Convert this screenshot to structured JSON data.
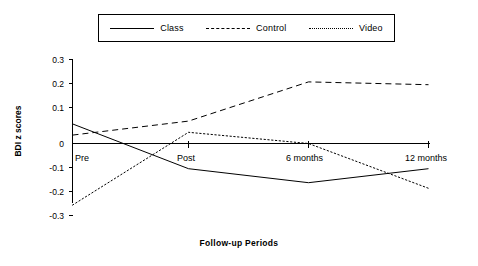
{
  "chart_data": {
    "type": "line",
    "title": "",
    "xlabel": "Follow-up  Periods",
    "ylabel": "BDI z scores",
    "categories": [
      "Pre",
      "Post",
      "6 months",
      "12 months"
    ],
    "ylim": [
      -0.3,
      0.3
    ],
    "ytick_labels": [
      "0.3",
      "0.2",
      "0.1",
      "0",
      "-0.1",
      "-0.2",
      "-0.3"
    ],
    "ytick_values": [
      0.3,
      0.2,
      0.1,
      0,
      -0.1,
      -0.2,
      -0.3
    ],
    "grid": false,
    "legend_position": "top-center",
    "series": [
      {
        "name": "Class",
        "style": "solid",
        "color": "#000000",
        "values": [
          0.07,
          -0.09,
          -0.14,
          -0.09
        ]
      },
      {
        "name": "Control",
        "style": "dashed",
        "color": "#000000",
        "values": [
          0.03,
          0.08,
          0.22,
          0.21
        ]
      },
      {
        "name": "Video",
        "style": "dotted",
        "color": "#000000",
        "values": [
          -0.22,
          0.04,
          0.0,
          -0.16
        ]
      }
    ]
  },
  "legend": {
    "entries": [
      {
        "label": "Class"
      },
      {
        "label": "Control"
      },
      {
        "label": "Video"
      }
    ]
  },
  "axes": {
    "y_title": "BDI z scores",
    "x_title": "Follow-up  Periods",
    "y_ticks": [
      "0.3",
      "0.2",
      "0.1",
      "0",
      "-0.1",
      "-0.2",
      "-0.3"
    ],
    "x_ticks": [
      "Pre",
      "Post",
      "6 months",
      "12 months"
    ]
  }
}
